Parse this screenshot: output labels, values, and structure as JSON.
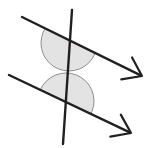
{
  "figure": {
    "width": 146,
    "height": 148,
    "background_color": "#FFFFFF",
    "line_color": "#231F20",
    "arc_fill_color": "#E3E3E3",
    "arc_stroke_color": "#8C8C8C",
    "line_width": 2.4,
    "arc_stroke_width": 1.0
  },
  "chart_data": {
    "type": "diagram",
    "xlabel": "",
    "ylabel": "",
    "coordinate_space": {
      "x_range": [
        0,
        146
      ],
      "y_range": [
        0,
        148
      ],
      "y_axis": "down"
    },
    "elements": [
      {
        "id": "upper-parallel-line",
        "kind": "ray",
        "label": "upper parallel line",
        "start": [
          22,
          17
        ],
        "end": [
          142,
          76
        ],
        "arrowhead_at": "end",
        "stroke": "#231F20"
      },
      {
        "id": "lower-parallel-line",
        "kind": "ray",
        "label": "lower parallel line",
        "start": [
          9,
          75
        ],
        "end": [
          131,
          133
        ],
        "arrowhead_at": "end",
        "stroke": "#231F20"
      },
      {
        "id": "transversal-line",
        "kind": "segment",
        "label": "transversal",
        "start": [
          72,
          10
        ],
        "end": [
          63,
          144
        ],
        "arrowhead_at": "none",
        "stroke": "#231F20"
      }
    ],
    "intersections": [
      {
        "id": "upper-intersection",
        "point": [
          69,
          43
        ],
        "lines": [
          "upper-parallel-line",
          "transversal-line"
        ]
      },
      {
        "id": "lower-intersection",
        "point": [
          66,
          101
        ],
        "lines": [
          "lower-parallel-line",
          "transversal-line"
        ]
      }
    ],
    "angle_markers": [
      {
        "id": "upper-angle-marker",
        "shape": "semicircle",
        "center": [
          69,
          43
        ],
        "radius": 28,
        "side": "below",
        "start_angle_deg": 26,
        "end_angle_deg": 206,
        "fill": "#E3E3E3",
        "stroke": "#8C8C8C"
      },
      {
        "id": "lower-angle-marker",
        "shape": "semicircle",
        "center": [
          66,
          101
        ],
        "radius": 28,
        "side": "above",
        "start_angle_deg": 206,
        "end_angle_deg": 386,
        "fill": "#E3E3E3",
        "stroke": "#8C8C8C"
      }
    ],
    "annotations": [],
    "legend": [],
    "grid": false
  }
}
